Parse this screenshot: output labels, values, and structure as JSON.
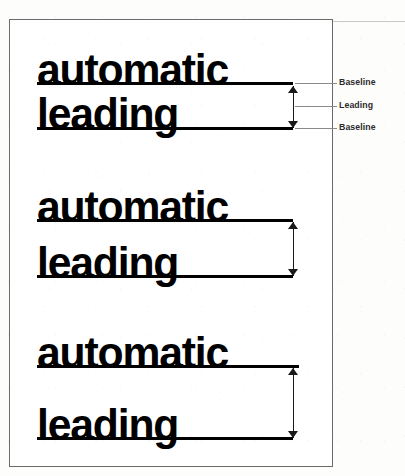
{
  "figure": {
    "caption_text_line1": "automatic",
    "caption_text_line2": "leading",
    "specimens": [
      {
        "id": "tight-leading",
        "line1": "automatic",
        "line2": "leading",
        "baseline1_y": 83,
        "baseline2_y": 128,
        "leading_px": 45,
        "annotated": true
      },
      {
        "id": "medium-leading",
        "line1": "automatic",
        "line2": "leading",
        "baseline1_y": 219,
        "baseline2_y": 275,
        "leading_px": 56,
        "annotated": false
      },
      {
        "id": "loose-leading",
        "line1": "automatic",
        "line2": "leading",
        "baseline1_y": 365,
        "baseline2_y": 437,
        "leading_px": 72,
        "annotated": false
      }
    ],
    "annotations": [
      {
        "id": "baseline-top",
        "label": "Baseline",
        "y": 83
      },
      {
        "id": "leading-measure",
        "label": "Leading",
        "y": 106
      },
      {
        "id": "baseline-bottom",
        "label": "Baseline",
        "y": 128
      }
    ],
    "colors": {
      "ink": "#000000",
      "frame": "#6b6b6b",
      "leader_line": "#8a8a8a",
      "label_text": "#2b2b2b",
      "paper": "#ffffff"
    }
  }
}
